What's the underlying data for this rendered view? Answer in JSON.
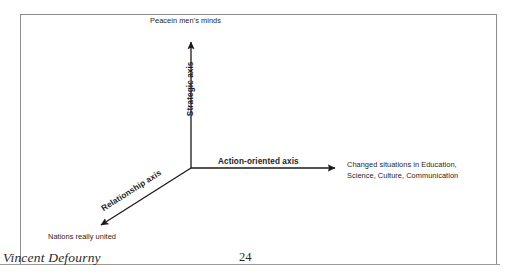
{
  "document": {
    "page_number": "24",
    "author": "Vincent Defourny"
  },
  "diagram": {
    "type": "three-axis-diagram",
    "origin": {
      "x": 191,
      "y": 168
    },
    "line_color": "#1a1a1a",
    "axes": [
      {
        "id": "strategic",
        "caption": "Strategic axis",
        "endpoint_label": "Peacein men's minds",
        "direction": "up",
        "tip": {
          "x": 191,
          "y": 38
        }
      },
      {
        "id": "action-oriented",
        "caption": "Action-oriented axis",
        "endpoint_label": "Changed situations in Education, Science, Culture, Communication",
        "endpoint_label_line1": "Changed situations in Education,",
        "endpoint_label_line2": "Science, Culture, Communication",
        "direction": "right",
        "tip": {
          "x": 339,
          "y": 168
        }
      },
      {
        "id": "relationship",
        "caption": "Relationship axis",
        "endpoint_label": "Nations really united",
        "direction": "down-left",
        "tip": {
          "x": 97,
          "y": 228
        }
      }
    ]
  }
}
